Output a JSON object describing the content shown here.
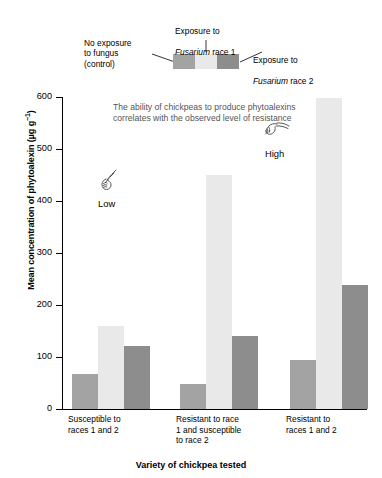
{
  "legend": {
    "swatch_labels": [
      {
        "id": "control",
        "text": "No exposure\nto fungus\n(control)",
        "color": "#a3a3a3"
      },
      {
        "id": "race1",
        "text": "Exposure to",
        "text2": "Fusarium",
        "text3": " race 1",
        "color": "#e9e9e9"
      },
      {
        "id": "race2",
        "text": "Exposure to",
        "text2": "Fusarium",
        "text3": " race 2",
        "color": "#8d8d8d"
      }
    ],
    "control_label": "No exposure\nto fungus\n(control)",
    "race1_line1": "Exposure to",
    "race1_italic": "Fusarium",
    "race1_tail": " race 1",
    "race2_line1": "Exposure to",
    "race2_italic": "Fusarium",
    "race2_tail": " race 2"
  },
  "annotation": {
    "text": "The ability of chickpeas to produce phytoalexins correlates with the observed level of resistance",
    "low_label": "Low",
    "high_label": "High",
    "color": "#555555"
  },
  "chart_data": {
    "type": "bar",
    "title": "",
    "xlabel": "Variety of chickpea tested",
    "ylabel": "Mean concentration of phytoalexin (µg g⁻¹)",
    "ylim": [
      0,
      600
    ],
    "yticks": [
      0,
      100,
      200,
      300,
      400,
      500,
      600
    ],
    "ytick_labels": [
      "0",
      "100",
      "200",
      "300",
      "400",
      "500",
      "600"
    ],
    "grid": false,
    "legend_position": "top",
    "categories": [
      "Susceptible to\nraces 1 and 2",
      "Resistant to race\n1 and susceptible\nto race 2",
      "Resistant to\nraces 1 and 2"
    ],
    "series": [
      {
        "name": "No exposure to fungus (control)",
        "color": "#a3a3a3",
        "values": [
          67,
          48,
          94
        ]
      },
      {
        "name": "Exposure to Fusarium race 1",
        "color": "#e9e9e9",
        "values": [
          160,
          450,
          598
        ]
      },
      {
        "name": "Exposure to Fusarium race 2",
        "color": "#8d8d8d",
        "values": [
          121,
          140,
          239
        ]
      }
    ]
  }
}
